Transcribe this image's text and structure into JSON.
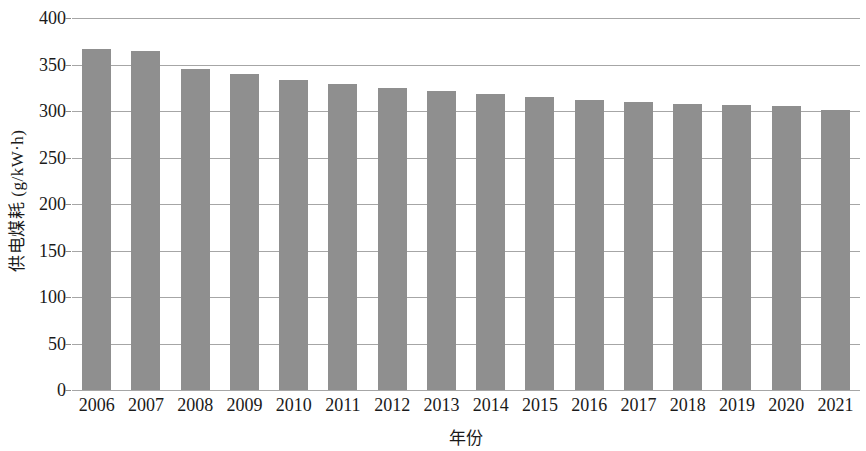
{
  "chart_data": {
    "type": "bar",
    "title": "",
    "xlabel": "年份",
    "ylabel": "供电煤耗 (g/kW·h)",
    "categories": [
      "2006",
      "2007",
      "2008",
      "2009",
      "2010",
      "2011",
      "2012",
      "2013",
      "2014",
      "2015",
      "2016",
      "2017",
      "2018",
      "2019",
      "2020",
      "2021"
    ],
    "values": [
      367,
      365,
      345,
      340,
      333,
      329,
      325,
      321,
      318,
      315,
      312,
      310,
      308,
      307,
      305,
      301
    ],
    "series": [
      {
        "name": "供电煤耗",
        "values": [
          367,
          365,
          345,
          340,
          333,
          329,
          325,
          321,
          318,
          315,
          312,
          310,
          308,
          307,
          305,
          301
        ]
      }
    ],
    "ylim": [
      0,
      400
    ],
    "y_ticks": [
      "400",
      "350",
      "300",
      "250",
      "200",
      "150",
      "100",
      "50",
      "0"
    ],
    "y_tick_values": [
      400,
      350,
      300,
      250,
      200,
      150,
      100,
      50,
      0
    ],
    "y_tick_step": 50,
    "grid": "horizontal",
    "legend": "none",
    "bar_color": "#8f8f8f",
    "gridline_color": "#a6a6a6"
  }
}
